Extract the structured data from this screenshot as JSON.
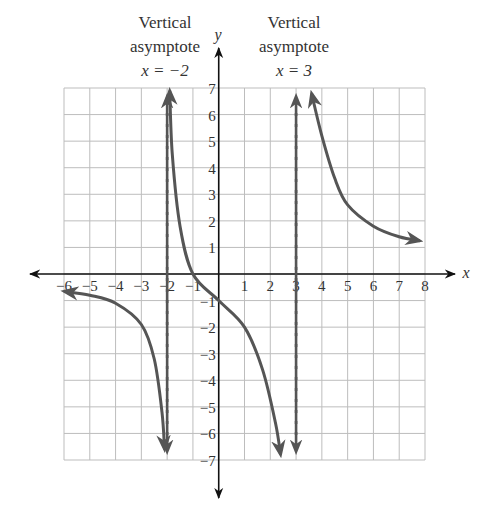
{
  "chart_data": {
    "type": "line",
    "title": "",
    "xlabel": "x",
    "ylabel": "y",
    "xlim": [
      -6,
      8
    ],
    "ylim": [
      -7,
      7
    ],
    "grid": true,
    "x_ticks": [
      "-6",
      "-5",
      "-4",
      "-3",
      "-2",
      "-1",
      "1",
      "2",
      "3",
      "4",
      "5",
      "6",
      "7",
      "8"
    ],
    "y_ticks": [
      "7",
      "6",
      "5",
      "4",
      "3",
      "2",
      "1",
      "-1",
      "-2",
      "-3",
      "-4",
      "-5",
      "-6",
      "-7"
    ],
    "vertical_asymptotes": [
      {
        "x": -2,
        "label_line1": "Vertical",
        "label_line2": "asymptote",
        "label_eq": "x = −2"
      },
      {
        "x": 3,
        "label_line1": "Vertical",
        "label_line2": "asymptote",
        "label_eq": "x = 3"
      }
    ],
    "series": [
      {
        "name": "left-branch",
        "points": [
          [
            -6,
            -0.65
          ],
          [
            -5,
            -0.8
          ],
          [
            -4,
            -1.1
          ],
          [
            -3,
            -1.9
          ],
          [
            -2.5,
            -3.2
          ],
          [
            -2.2,
            -5.2
          ],
          [
            -2.1,
            -6.6
          ]
        ]
      },
      {
        "name": "middle-branch",
        "points": [
          [
            -1.9,
            6.9
          ],
          [
            -1.8,
            4.5
          ],
          [
            -1.5,
            1.8
          ],
          [
            -1,
            0
          ],
          [
            0,
            -1
          ],
          [
            1,
            -2
          ],
          [
            1.7,
            -3.6
          ],
          [
            2.2,
            -5.6
          ],
          [
            2.4,
            -6.8
          ]
        ]
      },
      {
        "name": "right-branch",
        "points": [
          [
            3.6,
            6.8
          ],
          [
            4,
            5.2
          ],
          [
            4.5,
            3.6
          ],
          [
            5,
            2.6
          ],
          [
            6,
            1.8
          ],
          [
            7,
            1.4
          ],
          [
            7.8,
            1.25
          ]
        ]
      }
    ]
  },
  "labels": {
    "asym_left_line1": "Vertical",
    "asym_left_line2": "asymptote",
    "asym_left_eq": "x = −2",
    "asym_right_line1": "Vertical",
    "asym_right_line2": "asymptote",
    "asym_right_eq": "x = 3",
    "x_axis": "x",
    "y_axis": "y"
  }
}
